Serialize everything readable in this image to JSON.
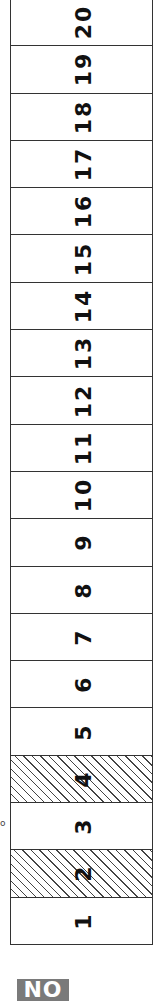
{
  "strip": {
    "cells": [
      {
        "label": "20",
        "hatched": false
      },
      {
        "label": "19",
        "hatched": false
      },
      {
        "label": "18",
        "hatched": false
      },
      {
        "label": "17",
        "hatched": false
      },
      {
        "label": "16",
        "hatched": false
      },
      {
        "label": "15",
        "hatched": false
      },
      {
        "label": "14",
        "hatched": false
      },
      {
        "label": "13",
        "hatched": false
      },
      {
        "label": "12",
        "hatched": false
      },
      {
        "label": "11",
        "hatched": false
      },
      {
        "label": "10",
        "hatched": false
      },
      {
        "label": "9",
        "hatched": false
      },
      {
        "label": "8",
        "hatched": false
      },
      {
        "label": "7",
        "hatched": false
      },
      {
        "label": "6",
        "hatched": false
      },
      {
        "label": "5",
        "hatched": false
      },
      {
        "label": "4",
        "hatched": true
      },
      {
        "label": "3",
        "hatched": false
      },
      {
        "label": "2",
        "hatched": true
      },
      {
        "label": "1",
        "hatched": false
      }
    ]
  },
  "side_mark": "o",
  "badge": {
    "label": "NO"
  }
}
